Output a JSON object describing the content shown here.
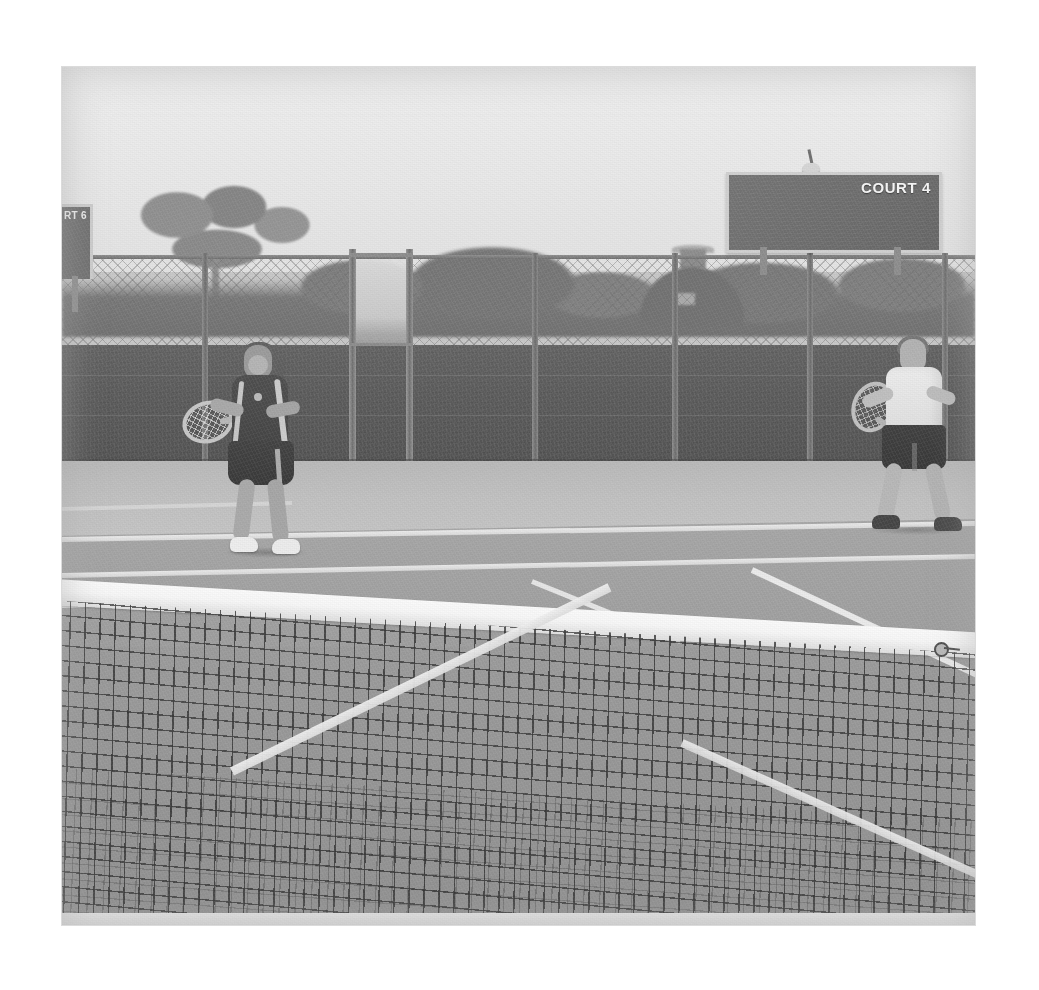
{
  "scene": {
    "type": "photograph",
    "subject": "Two tennis players in ready position on an outdoor hard court, viewed from behind the net",
    "color_mode": "black-and-white",
    "setting": "outdoor tennis court, overcast sky",
    "caption": "Tennis players on Court 4"
  },
  "signage": {
    "scoreboard": {
      "label": "COURT 4",
      "board_color": "#6a6a6a",
      "frame_color": "#d2d2d2",
      "text_color": "#fafafa"
    },
    "left_sign": {
      "label": "RT 6",
      "note": "partially cropped court sign at left edge"
    }
  },
  "players": {
    "left": {
      "name": "left-player",
      "description": "female player in ready position",
      "top": "dark polo shirt with light side stripes",
      "bottom": "dark skirt",
      "shoes": "white",
      "hair": "dark, ponytail",
      "racket": "held low in front with both hands"
    },
    "right": {
      "name": "right-player",
      "description": "male player in ready position",
      "top": "white t-shirt",
      "bottom": "dark shorts",
      "shoes": "dark",
      "hair": "short, light",
      "racket": "held up in front of body"
    }
  },
  "court": {
    "surface": "hard court",
    "net": "dark mesh net with white head tape across foreground",
    "lines": [
      "far baseline",
      "far service line",
      "right doubles sideline",
      "centre service line",
      "left service sideline"
    ],
    "fence": "chain-link perimeter fence with dark windscreen and a gate",
    "background": "trees, a domed building with cupola, and a utility pole beyond the fence"
  },
  "colors": {
    "page_background": "#ffffff",
    "sky": "#ececec",
    "court_far": "#a1a1a1",
    "court_near": "#939393",
    "windscreen": "#575757",
    "line_white": "#f0f0f0",
    "net_mesh": "#282828"
  }
}
